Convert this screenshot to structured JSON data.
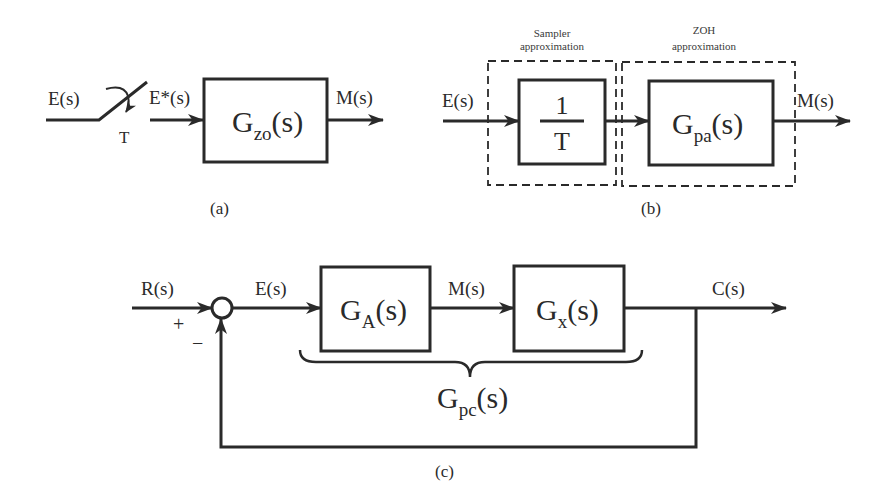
{
  "colors": {
    "stroke": "#2a2a2a",
    "background": "#ffffff"
  },
  "diagram_a": {
    "caption": "(a)",
    "input_label": "E(s)",
    "sampler_period_label": "T",
    "sampled_label": "E*(s)",
    "block": {
      "main": "G",
      "sub": "zo",
      "tail": "(s)"
    },
    "output_label": "M(s)"
  },
  "diagram_b": {
    "caption": "(b)",
    "input_label": "E(s)",
    "sampler_group_label_1": "Sampler",
    "sampler_group_label_2": "approximation",
    "zoh_group_label_1": "ZOH",
    "zoh_group_label_2": "approximation",
    "sampler_block": {
      "numerator": "1",
      "denominator": "T"
    },
    "zoh_block": {
      "main": "G",
      "sub": "pa",
      "tail": "(s)"
    },
    "output_label": "M(s)"
  },
  "diagram_c": {
    "caption": "(c)",
    "reference_label": "R(s)",
    "plus_sign": "+",
    "minus_sign": "−",
    "error_label": "E(s)",
    "block_a": {
      "main": "G",
      "sub": "A",
      "tail": "(s)"
    },
    "intermediate_label": "M(s)",
    "block_x": {
      "main": "G",
      "sub": "x",
      "tail": "(s)"
    },
    "output_label": "C(s)",
    "brace_label": {
      "main": "G",
      "sub": "pc",
      "tail": "(s)"
    }
  }
}
